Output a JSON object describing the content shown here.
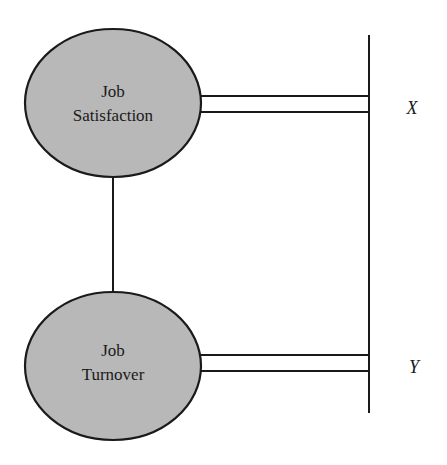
{
  "diagram": {
    "colors": {
      "node_fill": "#b8b8b8",
      "stroke": "#1a1a1a",
      "background": "#ffffff"
    },
    "nodes": [
      {
        "id": "job-satisfaction",
        "lines": [
          "Job",
          "Satisfaction"
        ]
      },
      {
        "id": "job-turnover",
        "lines": [
          "Job",
          "Turnover"
        ]
      }
    ],
    "edges": [
      {
        "from": "job-satisfaction",
        "to": "job-turnover",
        "type": "single-line"
      },
      {
        "from": "job-satisfaction",
        "to": "axis",
        "type": "double-line",
        "label": "X"
      },
      {
        "from": "job-turnover",
        "to": "axis",
        "type": "double-line",
        "label": "Y"
      }
    ],
    "axis_labels": {
      "x": "X",
      "y": "Y"
    }
  }
}
